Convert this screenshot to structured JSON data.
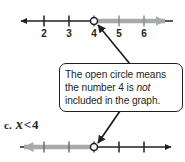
{
  "figure": {
    "partial_top_text": "",
    "colors": {
      "ink": "#231f20",
      "highlight": "#a7a9ac",
      "page_background": "#ffffff",
      "callout_border": "#231f20"
    }
  },
  "number_line_top": {
    "name": "number-line-top",
    "tick_labels": [
      "2",
      "3",
      "4",
      "5",
      "6"
    ],
    "tick_positions_px": [
      44,
      69,
      94,
      119,
      144
    ],
    "axis_y_px": 21,
    "open_circle_at": "4",
    "open_circle_x_px": 94,
    "ray_direction": "right",
    "ray_color": "#a7a9ac",
    "base_line_color": "#231f20",
    "left_arrow_x_px": 20,
    "right_arrow_x_px": 173
  },
  "number_line_bottom": {
    "name": "number-line-bottom",
    "tick_labels": [],
    "tick_positions_px": [
      44,
      69,
      94,
      119,
      144
    ],
    "axis_y_px": 147,
    "open_circle_at": "4",
    "open_circle_x_px": 94,
    "ray_direction": "left",
    "ray_color": "#a7a9ac",
    "base_line_color": "#231f20",
    "left_arrow_x_px": 14,
    "right_arrow_x_px": 172
  },
  "callout": {
    "name": "open-circle-callout",
    "line1": "The open circle means",
    "line2_before_italic": "the number 4 is ",
    "line2_italic": "not",
    "line3": "included in the graph.",
    "full_text": "The open circle means the number 4 is not included in the graph."
  },
  "part_label": {
    "letter": "c.",
    "variable": "x",
    "operator": "<",
    "value": "4",
    "full": "c. x < 4"
  },
  "pointers": [
    {
      "name": "callout-pointer-up",
      "from_x": 129,
      "from_y": 63,
      "to_x": 96,
      "to_y": 24
    },
    {
      "name": "callout-pointer-down",
      "from_x": 119,
      "from_y": 112,
      "to_x": 97,
      "to_y": 144
    }
  ]
}
